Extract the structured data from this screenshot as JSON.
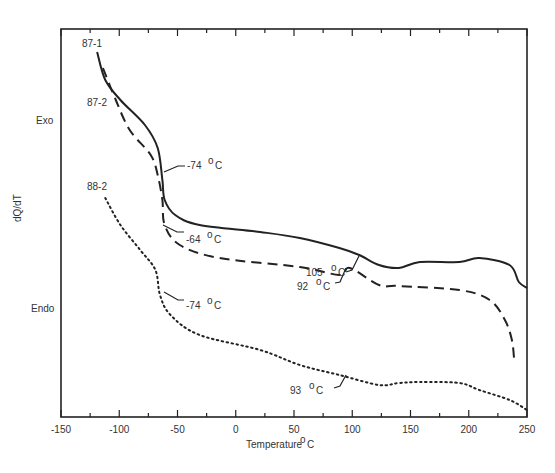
{
  "chart_data": {
    "type": "line",
    "title": "",
    "xlabel": "Temperature °C",
    "ylabel": "dQ/dT",
    "xlim": [
      -150,
      250
    ],
    "x_ticks": [
      -150,
      -100,
      -50,
      0,
      50,
      100,
      150,
      200,
      250
    ],
    "y_annotations": {
      "top": "Exo",
      "bottom": "Endo"
    },
    "grid": false,
    "series": [
      {
        "name": "87-1",
        "style": "solid",
        "x": [
          -119,
          -112,
          -99,
          -78,
          -67,
          -63,
          -61,
          -52,
          -31,
          21,
          55,
          89,
          106,
          123,
          140,
          158,
          192,
          209,
          235,
          243,
          250
        ],
        "y_px": [
          52,
          80,
          100,
          125,
          148,
          180,
          200,
          215,
          225,
          232,
          238,
          248,
          255,
          265,
          268,
          262,
          262,
          258,
          265,
          282,
          288
        ]
      },
      {
        "name": "87-2",
        "style": "dashed",
        "x": [
          -114,
          -103,
          -91,
          -73,
          -67,
          -63,
          -61,
          -48,
          -14,
          55,
          89,
          98,
          123,
          140,
          192,
          218,
          231,
          237,
          239
        ],
        "y_px": [
          68,
          100,
          130,
          155,
          175,
          200,
          225,
          245,
          258,
          267,
          275,
          268,
          285,
          286,
          290,
          300,
          320,
          340,
          360
        ]
      },
      {
        "name": "88-2",
        "style": "dotted",
        "x": [
          -112,
          -99,
          -82,
          -69,
          -65,
          -56,
          -31,
          21,
          55,
          89,
          123,
          140,
          158,
          192,
          209,
          235,
          250
        ],
        "y_px": [
          198,
          225,
          250,
          270,
          295,
          315,
          335,
          350,
          365,
          375,
          385,
          383,
          382,
          383,
          390,
          400,
          410
        ]
      }
    ],
    "annotations": [
      {
        "text": "-74 °C",
        "series": "87-1"
      },
      {
        "text": "-64 °C",
        "series": "87-2"
      },
      {
        "text": "-74 °C",
        "series": "88-2"
      },
      {
        "text": "105 °C",
        "series": "87-1"
      },
      {
        "text": "92 °C",
        "series": "87-2"
      },
      {
        "text": "93 °C",
        "series": "88-2"
      }
    ]
  },
  "labels": {
    "exo": "Exo",
    "endo": "Endo",
    "ylabel": "dQ/dT",
    "xlabel": "Temperature",
    "xlabel_unit": "C",
    "deg": "o",
    "series1": "87-1",
    "series2": "87-2",
    "series3": "88-2",
    "ann1": "-74",
    "ann2": "-64",
    "ann3": "-74",
    "ann4": "105",
    "ann5": "92",
    "ann6": "93",
    "ticks": [
      "-150",
      "-100",
      "-50",
      "0",
      "50",
      "100",
      "150",
      "200",
      "250"
    ]
  }
}
